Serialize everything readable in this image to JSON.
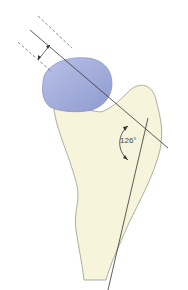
{
  "diagram": {
    "angle_label": "126°",
    "colors": {
      "bone": "#f7f4dc",
      "bone_outline": "#9a9a8a",
      "head": "#aab3dd",
      "lines": "#333333",
      "dashed": "#555555"
    }
  }
}
